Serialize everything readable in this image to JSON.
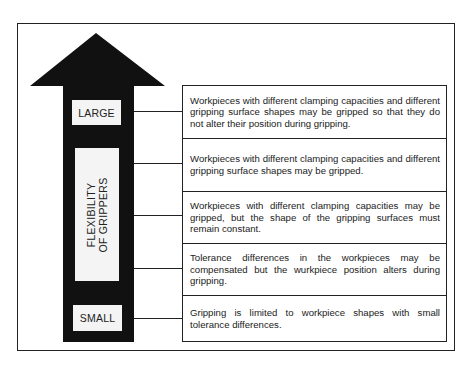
{
  "diagram": {
    "arrow": {
      "direction": "up",
      "color": "#111111",
      "top_label": "LARGE",
      "bottom_label": "SMALL",
      "axis_label_line1": "FLEXIBILITY",
      "axis_label_line2": "OF GRIPPERS"
    },
    "levels": [
      {
        "text": "Workpieces with different clamping capacities and different gripping surface shapes may be gripped so that they do not alter their position during gripping."
      },
      {
        "text": "Workpieces with different clamping capacities and different gripping surface shapes may be gripped."
      },
      {
        "text": "Workpieces with different clamping capacities may be gripped, but the shape of the gripping surfaces must remain constant."
      },
      {
        "text": "Tolerance differences in the workpieces may be compensated but the wurkpiece position alters during gripping."
      },
      {
        "text": "Gripping is limited to workpiece shapes with small tolerance differences."
      }
    ]
  }
}
